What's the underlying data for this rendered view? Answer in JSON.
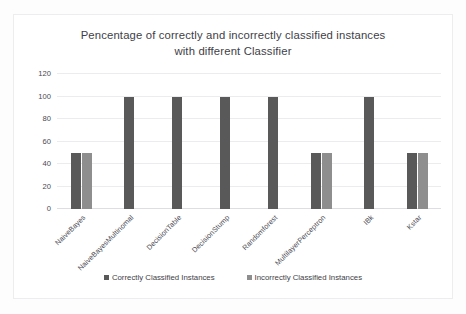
{
  "chart_data": {
    "type": "bar",
    "title": "Pencentage of correctly and incorrectly classified instances\nwith different Classifier",
    "xlabel": "",
    "ylabel": "",
    "ylim": [
      0,
      120
    ],
    "yticks": [
      0,
      20,
      40,
      60,
      80,
      100,
      120
    ],
    "grid": true,
    "legend_position": "bottom",
    "categories": [
      "NaiveBayes",
      "NaiveBayesMultinomal",
      "DecisionTable",
      "DecisionStump",
      "Randomforest",
      "MultilayerPerceptron",
      "IBk",
      "Kstar"
    ],
    "series": [
      {
        "name": "Correctly Classified Instances",
        "color": "#595959",
        "values": [
          50,
          100,
          100,
          100,
          100,
          50,
          100,
          50
        ]
      },
      {
        "name": "Incorrectly Classified Instances",
        "color": "#8e8e8e",
        "values": [
          50,
          0,
          0,
          0,
          0,
          50,
          0,
          50
        ]
      }
    ]
  }
}
